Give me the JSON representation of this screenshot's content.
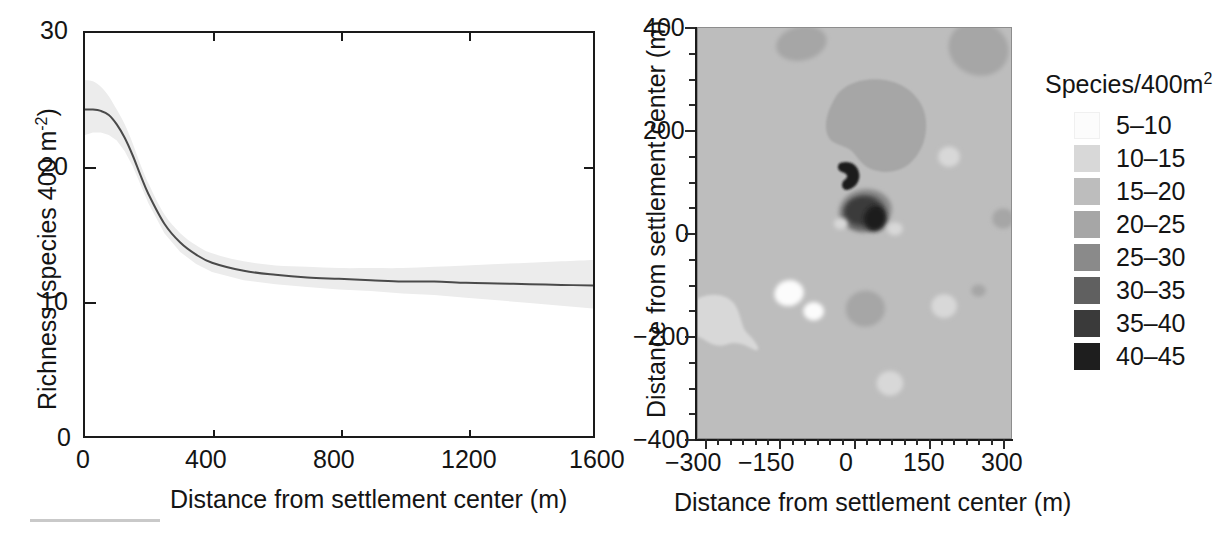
{
  "figure": {
    "panels": [
      "richness-distance-curve",
      "richness-contour-map"
    ]
  },
  "left_panel": {
    "y_axis": {
      "title_main": "Richness (species 400 m",
      "title_exponent": "-2",
      "title_tail": ")",
      "ticks": [
        "0",
        "10",
        "20",
        "30"
      ],
      "range": [
        0,
        30
      ]
    },
    "x_axis": {
      "title": "Distance from settlement center (m)",
      "ticks": [
        "0",
        "400",
        "800",
        "1200",
        "1600"
      ],
      "range": [
        0,
        1600
      ]
    }
  },
  "right_panel": {
    "y_axis": {
      "title": "Distance from settlement center (m)",
      "ticks": [
        "400",
        "200",
        "0",
        "-200",
        "-400"
      ],
      "range": [
        -400,
        400
      ]
    },
    "x_axis": {
      "title": "Distance from settlement center (m)",
      "ticks": [
        "-300",
        "-150",
        "0",
        "150",
        "300"
      ],
      "range": [
        -320,
        320
      ]
    }
  },
  "legend": {
    "title_main": "Species/400m",
    "title_exponent": "2",
    "items": [
      {
        "label": "5-10",
        "color": "#fcfcfc"
      },
      {
        "label": "10-15",
        "color": "#d8d8d8"
      },
      {
        "label": "15-20",
        "color": "#bdbdbd"
      },
      {
        "label": "20-25",
        "color": "#a6a6a6"
      },
      {
        "label": "25-30",
        "color": "#8a8a8a"
      },
      {
        "label": "30-35",
        "color": "#606060"
      },
      {
        "label": "35-40",
        "color": "#3a3a3a"
      },
      {
        "label": "40-45",
        "color": "#1e1e1e"
      }
    ]
  },
  "chart_data": [
    {
      "type": "line",
      "id": "richness-vs-distance",
      "title": "",
      "xlabel": "Distance from settlement center (m)",
      "ylabel": "Richness (species 400 m-2)",
      "xlim": [
        0,
        1600
      ],
      "ylim": [
        0,
        30
      ],
      "xticks": [
        0,
        400,
        800,
        1200,
        1600
      ],
      "yticks": [
        0,
        10,
        20,
        30
      ],
      "grid": false,
      "legend_position": "none",
      "series": [
        {
          "name": "fitted richness",
          "color": "#4a4a4a",
          "x": [
            0,
            25,
            50,
            75,
            100,
            125,
            150,
            175,
            200,
            250,
            300,
            350,
            400,
            500,
            600,
            700,
            800,
            900,
            1000,
            1100,
            1200,
            1300,
            1400,
            1500,
            1600
          ],
          "values": [
            24.3,
            24.3,
            24.2,
            23.9,
            23.2,
            22.2,
            20.9,
            19.4,
            18.0,
            15.8,
            14.4,
            13.5,
            12.9,
            12.3,
            12.0,
            11.8,
            11.7,
            11.6,
            11.5,
            11.5,
            11.4,
            11.35,
            11.3,
            11.25,
            11.2
          ]
        }
      ],
      "confidence_band": {
        "name": "95% confidence interval",
        "color": "#ececec",
        "x": [
          0,
          25,
          50,
          75,
          100,
          125,
          150,
          175,
          200,
          250,
          300,
          350,
          400,
          500,
          600,
          700,
          800,
          900,
          1000,
          1100,
          1200,
          1300,
          1400,
          1500,
          1600
        ],
        "upper": [
          26.5,
          26.4,
          26.0,
          25.3,
          24.3,
          23.2,
          21.8,
          20.2,
          18.8,
          16.5,
          15.1,
          14.2,
          13.6,
          13.0,
          12.7,
          12.6,
          12.5,
          12.5,
          12.5,
          12.6,
          12.7,
          12.8,
          12.9,
          13.0,
          13.1
        ],
        "lower": [
          22.4,
          22.6,
          22.6,
          22.4,
          22.0,
          21.2,
          20.1,
          18.7,
          17.3,
          15.1,
          13.7,
          12.8,
          12.2,
          11.6,
          11.3,
          11.1,
          10.9,
          10.8,
          10.6,
          10.5,
          10.3,
          10.1,
          9.9,
          9.7,
          9.5
        ]
      }
    },
    {
      "type": "heatmap",
      "id": "richness-contour-map",
      "title": "",
      "xlabel": "Distance from settlement center (m)",
      "ylabel": "Distance from settlement center (m)",
      "xlim": [
        -320,
        320
      ],
      "ylim": [
        -400,
        400
      ],
      "xticks": [
        -300,
        -150,
        0,
        150,
        300
      ],
      "yticks": [
        -400,
        -200,
        0,
        200,
        400
      ],
      "grid": false,
      "legend_position": "right",
      "units": "Species/400m2",
      "class_breaks": [
        5,
        10,
        15,
        20,
        25,
        30,
        35,
        40,
        45
      ],
      "class_labels": [
        "5-10",
        "10-15",
        "15-20",
        "20-25",
        "25-30",
        "30-35",
        "35-40",
        "40-45"
      ],
      "background_class": "15-20",
      "features": [
        {
          "class": "20-25",
          "center_x": -110,
          "center_y": 370,
          "note": "patch top-left"
        },
        {
          "class": "20-25",
          "center_x": 250,
          "center_y": 360,
          "note": "patch top-right"
        },
        {
          "class": "20-25",
          "center_x": 35,
          "center_y": 110,
          "note": "large central halo"
        },
        {
          "class": "25-30",
          "center_x": 20,
          "center_y": 45,
          "note": "inner ring of hotspot"
        },
        {
          "class": "30-35",
          "center_x": 18,
          "center_y": 42,
          "note": "hotspot mid ring"
        },
        {
          "class": "35-40",
          "center_x": 15,
          "center_y": 45,
          "note": "hotspot dark ring"
        },
        {
          "class": "40-45",
          "center_x": -5,
          "center_y": 60,
          "note": "peak lobe west"
        },
        {
          "class": "40-45",
          "center_x": 40,
          "center_y": 30,
          "note": "peak lobe east"
        },
        {
          "class": "10-15",
          "center_x": 190,
          "center_y": 150,
          "note": "light spot right"
        },
        {
          "class": "10-15",
          "center_x": -30,
          "center_y": 20,
          "note": "light spot near center"
        },
        {
          "class": "10-15",
          "center_x": 80,
          "center_y": 10,
          "note": "light spot east of core"
        },
        {
          "class": "10-15",
          "center_x": -160,
          "center_y": -180,
          "note": "large light region southwest"
        },
        {
          "class": "5-10",
          "center_x": -135,
          "center_y": -115,
          "note": "very light core southwest"
        },
        {
          "class": "5-10",
          "center_x": -85,
          "center_y": -150,
          "note": "very light spot southwest"
        },
        {
          "class": "20-25",
          "center_x": 20,
          "center_y": -145,
          "note": "dark patch south-center"
        },
        {
          "class": "10-15",
          "center_x": 180,
          "center_y": -140,
          "note": "light spot southeast"
        },
        {
          "class": "10-15",
          "center_x": 70,
          "center_y": -290,
          "note": "light spot south"
        },
        {
          "class": "20-25",
          "center_x": 250,
          "center_y": -110,
          "note": "small patch far east"
        },
        {
          "class": "20-25",
          "center_x": 300,
          "center_y": 30,
          "note": "edge patch east"
        }
      ]
    }
  ]
}
